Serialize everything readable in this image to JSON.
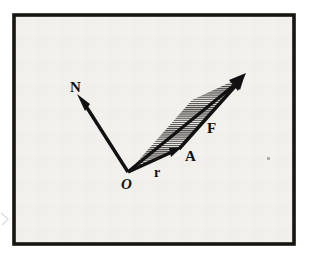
{
  "figure": {
    "kind": "vector-diagram",
    "caption_present": false,
    "background_color": "#ffffff",
    "panel_color": "#f2f0ec",
    "ink_color": "#111111",
    "frame": {
      "x": 12,
      "y": 13,
      "width": 284,
      "height": 233,
      "stroke_width": 4,
      "color": "#17150f"
    },
    "labels": {
      "origin": "O",
      "normal": "N",
      "position": "r",
      "area": "A",
      "force": "F"
    },
    "points": {
      "origin": {
        "x": 128,
        "y": 172
      },
      "normal_tip": {
        "x": 78,
        "y": 96
      },
      "r_tip": {
        "x": 180,
        "y": 148
      },
      "f_tip": {
        "x": 245,
        "y": 75
      },
      "parallelogram_far": {
        "x": 193,
        "y": 99
      }
    },
    "label_positions": {
      "origin": {
        "x": 126,
        "y": 187
      },
      "normal": {
        "x": 70,
        "y": 92
      },
      "position": {
        "x": 155,
        "y": 176
      },
      "area": {
        "x": 184,
        "y": 161
      },
      "force": {
        "x": 207,
        "y": 132
      }
    },
    "vectors": [
      {
        "name": "N",
        "label": "N",
        "from": "origin",
        "to": "normal_tip",
        "style": "solid-arrow"
      },
      {
        "name": "r",
        "label": "r",
        "from": "origin",
        "to": "r_tip",
        "style": "solid-arrow"
      },
      {
        "name": "F",
        "label": "F",
        "from": "r_tip",
        "to": "f_tip",
        "style": "solid-arrow"
      },
      {
        "name": "M",
        "label": "",
        "from": "origin",
        "to": "f_tip",
        "style": "solid-arrow-diagonal"
      }
    ],
    "hatched_region": {
      "name": "A",
      "label": "A",
      "fill_pattern": "fine-horizontal-hatch",
      "vertices": "origin, r_tip, f_tip, parallelogram_far"
    },
    "artifacts": [
      {
        "name": "scan-speck",
        "x": 268,
        "y": 158,
        "width": 3,
        "height": 3
      },
      {
        "name": "edge-smudge",
        "x": 1,
        "y": 212,
        "width": 8,
        "height": 14
      }
    ]
  }
}
